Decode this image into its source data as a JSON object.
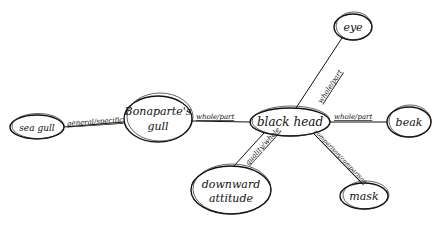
{
  "diagram": {
    "type": "semantic-network",
    "nodes": {
      "sea_gull": {
        "label": "sea gull",
        "cx": 37,
        "cy": 127,
        "rx": 27,
        "ry": 12
      },
      "bonaparte": {
        "line1": "Bonaparte's",
        "line2": "gull",
        "cx": 158,
        "cy": 119,
        "rx": 34,
        "ry": 23
      },
      "black_head": {
        "label": "black head",
        "cx": 290,
        "cy": 122,
        "rx": 40,
        "ry": 14
      },
      "eye": {
        "label": "eye",
        "cx": 353,
        "cy": 27,
        "rx": 19,
        "ry": 13
      },
      "beak": {
        "label": "beak",
        "cx": 409,
        "cy": 122,
        "rx": 22,
        "ry": 15
      },
      "downward_attitude": {
        "line1": "downward",
        "line2": "attitude",
        "cx": 231,
        "cy": 190,
        "rx": 40,
        "ry": 24
      },
      "mask": {
        "label": "mask",
        "cx": 364,
        "cy": 196,
        "rx": 24,
        "ry": 13
      }
    },
    "edges": [
      {
        "from": "sea gull",
        "to": "Bonaparte's gull",
        "label": "general/specific"
      },
      {
        "from": "Bonaparte's gull",
        "to": "black head",
        "label": "whole/part"
      },
      {
        "from": "black head",
        "to": "eye",
        "label": "whole/part"
      },
      {
        "from": "black head",
        "to": "beak",
        "label": "whole/part"
      },
      {
        "from": "black head",
        "to": "downward attitude",
        "label": "quality/whole"
      },
      {
        "from": "black head",
        "to": "mask",
        "label": "comparison/comparison"
      }
    ]
  }
}
